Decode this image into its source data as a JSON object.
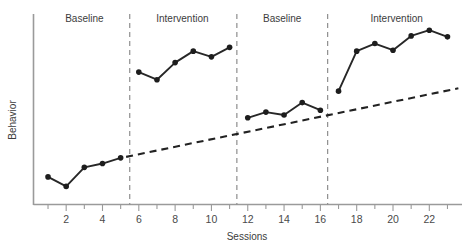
{
  "chart_data": {
    "type": "line",
    "title": "",
    "subtitle": "",
    "xlabel": "Sessions",
    "ylabel": "Behavior",
    "xlim": [
      0.2,
      23.8
    ],
    "ylim": [
      0,
      10
    ],
    "grid": false,
    "legend_position": "none",
    "x_ticks_major": [
      2,
      4,
      6,
      8,
      10,
      12,
      14,
      16,
      18,
      20,
      22
    ],
    "x_ticks_minor": [
      1,
      3,
      5,
      7,
      9,
      11,
      13,
      15,
      17,
      19,
      21,
      23
    ],
    "y_ticks": [],
    "phases": [
      {
        "name": "Baseline",
        "label": "Baseline",
        "x_start": 1,
        "x_end": 5,
        "label_x": 3.0
      },
      {
        "name": "Intervention",
        "label": "Intervention",
        "x_start": 6,
        "x_end": 11,
        "label_x": 8.4
      },
      {
        "name": "Baseline",
        "label": "Baseline",
        "x_start": 12,
        "x_end": 16,
        "label_x": 13.9
      },
      {
        "name": "Intervention",
        "label": "Intervention",
        "x_start": 17,
        "x_end": 23,
        "label_x": 20.2
      }
    ],
    "phase_dividers": [
      5.5,
      11.4,
      16.4
    ],
    "series": [
      {
        "name": "Behavior",
        "x": [
          1,
          2,
          3,
          4,
          5
        ],
        "values": [
          1.45,
          0.95,
          1.95,
          2.15,
          2.45
        ],
        "segment": "baseline-1"
      },
      {
        "name": "Behavior",
        "x": [
          6,
          7,
          8,
          9,
          10,
          11
        ],
        "values": [
          6.95,
          6.55,
          7.45,
          8.05,
          7.75,
          8.25
        ],
        "segment": "intervention-1"
      },
      {
        "name": "Behavior",
        "x": [
          12,
          13,
          14,
          15,
          16
        ],
        "values": [
          4.55,
          4.85,
          4.7,
          5.35,
          4.95
        ],
        "segment": "baseline-2"
      },
      {
        "name": "Behavior",
        "x": [
          17,
          18,
          19,
          20,
          21,
          22,
          23
        ],
        "values": [
          5.95,
          8.05,
          8.45,
          8.1,
          8.85,
          9.15,
          8.8
        ],
        "segment": "intervention-2"
      }
    ],
    "trend_line": {
      "name": "Projected baseline trend",
      "style": "dashed",
      "x": [
        5.3,
        23.6
      ],
      "values": [
        2.5,
        6.1
      ]
    },
    "annotations": []
  },
  "axis": {
    "x_label": "Sessions",
    "y_label": "Behavior"
  },
  "tick_labels": {
    "x": [
      "2",
      "4",
      "6",
      "8",
      "10",
      "12",
      "14",
      "16",
      "18",
      "20",
      "22"
    ]
  },
  "phase_labels": {
    "baseline_1": "Baseline",
    "intervention_1": "Intervention",
    "baseline_2": "Baseline",
    "intervention_2": "Intervention"
  },
  "colors": {
    "data_line": "#272727",
    "data_dot": "#1d1d1d",
    "trend_line": "#222222",
    "phase_divider": "#8e8e8e",
    "axis": "#9a9a9a",
    "text": "#3c3c3c",
    "background": "#ffffff"
  }
}
